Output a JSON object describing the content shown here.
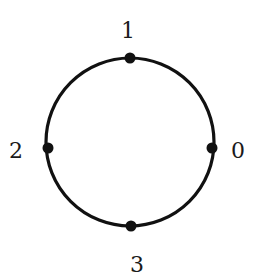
{
  "diagram": {
    "type": "cycle-graph",
    "circle": {
      "cx": 130,
      "cy": 142,
      "r": 84,
      "stroke": "#111111",
      "stroke_width": 3.2
    },
    "node_radius": 5.5,
    "node_color": "#111111",
    "nodes": [
      {
        "id": "0",
        "label": "0",
        "x": 212,
        "y": 148,
        "label_x": 238,
        "label_y": 158
      },
      {
        "id": "1",
        "label": "1",
        "x": 130,
        "y": 58,
        "label_x": 128,
        "label_y": 38
      },
      {
        "id": "2",
        "label": "2",
        "x": 48,
        "y": 148,
        "label_x": 16,
        "label_y": 158
      },
      {
        "id": "3",
        "label": "3",
        "x": 131,
        "y": 226,
        "label_x": 137,
        "label_y": 272
      }
    ]
  }
}
